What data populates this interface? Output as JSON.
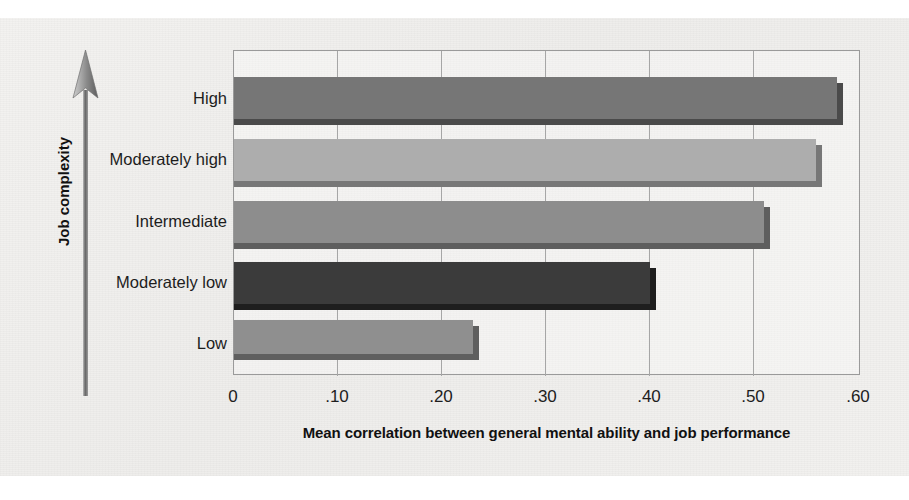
{
  "figure": {
    "credit": "© Cengage Learning 2013",
    "y_axis_title": "Job complexity",
    "x_axis_title": "Mean correlation between general mental ability and job performance",
    "arrow_icon": "up-arrow-icon"
  },
  "chart_data": {
    "type": "bar",
    "orientation": "horizontal",
    "title": "",
    "xlabel": "Mean correlation between general mental ability and job performance",
    "ylabel": "Job complexity",
    "xlim": [
      0,
      0.6
    ],
    "ylim": null,
    "grid": true,
    "legend": null,
    "xticks": [
      0,
      0.1,
      0.2,
      0.3,
      0.4,
      0.5,
      0.6
    ],
    "xticklabels": [
      "0",
      ".10",
      ".20",
      ".30",
      ".40",
      ".50",
      ".60"
    ],
    "categories": [
      "High",
      "Moderately high",
      "Intermediate",
      "Moderately low",
      "Low"
    ],
    "values": [
      0.58,
      0.56,
      0.51,
      0.4,
      0.23
    ],
    "colors": [
      "#767676",
      "#adadad",
      "#8d8d8d",
      "#3b3b3b",
      "#8f8f8f"
    ],
    "shadow_colors": [
      "#4a4a4a",
      "#777777",
      "#5e5e5e",
      "#1e1e1e",
      "#5f5f5f"
    ]
  }
}
